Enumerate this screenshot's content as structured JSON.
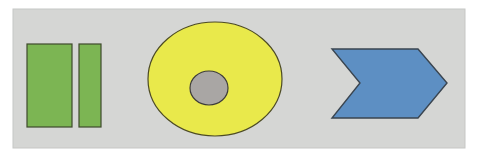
{
  "figure": {
    "title": "Geometric shapes figure",
    "width": 477,
    "height": 159,
    "page_background": "#ffffff",
    "panel": {
      "name": "shape-panel",
      "x": 13,
      "y": 9,
      "width": 452,
      "height": 139,
      "fill": "#d5d6d4",
      "stroke": "#c6c7c5",
      "stroke_width": 1
    }
  },
  "palette": {
    "green": "#7cb553",
    "green_outline": "#3f4a2c",
    "yellow": "#e9e94b",
    "yellow_outline": "#4d4b24",
    "gray_circle": "#a9a6a4",
    "gray_circle_outline": "#3d3c39",
    "blue": "#5d8fc3",
    "blue_outline": "#3a4550",
    "panel_gray": "#d5d6d4",
    "page_white": "#ffffff"
  },
  "shapes": [
    {
      "name": "green-rectangle-left",
      "type": "rect",
      "label": "Green rectangle (left)",
      "x": 27,
      "y": 44,
      "width": 45,
      "height": 83,
      "fill": "#7cb553",
      "stroke": "#3f4a2c",
      "stroke_width": 1.2
    },
    {
      "name": "green-rectangle-right",
      "type": "rect",
      "label": "Green rectangle (right)",
      "x": 79,
      "y": 44,
      "width": 22,
      "height": 83,
      "fill": "#7cb553",
      "stroke": "#3f4a2c",
      "stroke_width": 1.2
    },
    {
      "name": "yellow-ellipse",
      "type": "ellipse",
      "label": "Yellow ellipse",
      "cx": 215,
      "cy": 79,
      "rx": 67,
      "ry": 57,
      "fill": "#e9e94b",
      "stroke": "#4d4b24",
      "stroke_width": 1.2
    },
    {
      "name": "gray-inner-circle",
      "type": "ellipse",
      "label": "Gray inner circle",
      "cx": 209,
      "cy": 88,
      "rx": 19,
      "ry": 17,
      "fill": "#a9a6a4",
      "stroke": "#3d3c39",
      "stroke_width": 1.2
    },
    {
      "name": "blue-chevron-arrow",
      "type": "polygon",
      "label": "Blue chevron arrow pointing right",
      "points": "332,49 418,49 447,83 418,118 332,118 360,83",
      "fill": "#5d8fc3",
      "stroke": "#3a4550",
      "stroke_width": 1.4
    }
  ]
}
